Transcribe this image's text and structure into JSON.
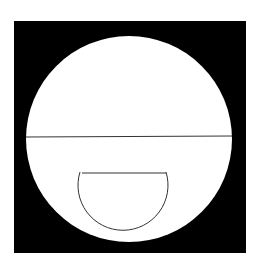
{
  "figure": {
    "background": "#ffffff",
    "square": {
      "x": 14,
      "y": 21,
      "width": 232,
      "height": 232,
      "fill": "#000000"
    },
    "big_circle": {
      "cx": 129,
      "cy": 139,
      "r": 103,
      "fill": "#ffffff"
    },
    "horizontal_line": {
      "x1": 26,
      "y1": 137,
      "x2": 232,
      "y2": 136,
      "stroke": "#333333"
    },
    "cup_shape": {
      "top_left": [
        80,
        172
      ],
      "top_right": [
        166,
        172
      ],
      "bottom_y": 244,
      "stroke": "#333333"
    }
  }
}
